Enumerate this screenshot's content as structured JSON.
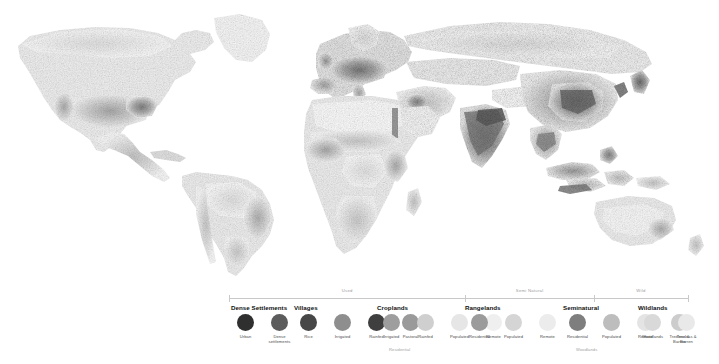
{
  "map": {
    "title": "Anthropogenic Biomes of the World",
    "ocean_color": "#ffffff",
    "land_base_color": "#f2f2f2",
    "projection_note": "world map, grayscale density"
  },
  "legend": {
    "tiers": [
      {
        "label": "Used",
        "start_pct": 0,
        "end_pct": 51.5
      },
      {
        "label": "Semi Natural",
        "start_pct": 51.5,
        "end_pct": 79.5
      },
      {
        "label": "Wild",
        "start_pct": 79.5,
        "end_pct": 100
      }
    ],
    "groups": [
      {
        "name": "Dense Settlements",
        "left": 230,
        "items": [
          {
            "label": "Urban",
            "color": "#2f2f2f"
          },
          {
            "label": "Dense settlements",
            "color": "#5c5c5c"
          }
        ]
      },
      {
        "name": "Villages",
        "left": 293,
        "items": [
          {
            "label": "Rice",
            "color": "#474747"
          },
          {
            "label": "Irrigated",
            "color": "#8e8e8e"
          },
          {
            "label": "Rainfed",
            "color": "#3f3f3f"
          },
          {
            "label": "Pastoral",
            "color": "#9a9a9a"
          }
        ]
      },
      {
        "name": "Croplands",
        "left": 376,
        "caption": "Residential",
        "caption_left": 389,
        "items": [
          {
            "label": "Irrigated",
            "color": "#9e9e9e"
          },
          {
            "label": "Rainfed",
            "color": "#cfcfcf"
          },
          {
            "label": "Populated",
            "color": "#e6e6e6"
          },
          {
            "label": "Remote",
            "color": "#efefef"
          }
        ]
      },
      {
        "name": "Rangelands",
        "left": 464,
        "items": [
          {
            "label": "Residential",
            "color": "#9b9b9b"
          },
          {
            "label": "Populated",
            "color": "#d5d5d5"
          },
          {
            "label": "Remote",
            "color": "#ececec"
          }
        ]
      },
      {
        "name": "Seminatural",
        "left": 562,
        "caption": "Woodlands",
        "caption_left": 576,
        "items": [
          {
            "label": "Residential",
            "color": "#7e7e7e"
          },
          {
            "label": "Populated",
            "color": "#bdbdbd"
          },
          {
            "label": "Remote",
            "color": "#e4e4e4"
          },
          {
            "label": "Treeless & Barren",
            "color": "#cccccc"
          }
        ]
      },
      {
        "name": "Wildlands",
        "left": 637,
        "items": [
          {
            "label": "Woodlands",
            "color": "#d9d9d9"
          },
          {
            "label": "Treeless & Barren",
            "color": "#e9e9e9"
          }
        ]
      }
    ]
  }
}
